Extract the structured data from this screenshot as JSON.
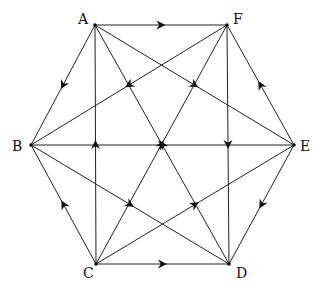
{
  "diagram": {
    "type": "directed-graph",
    "title": "",
    "stroke_color": "#222222",
    "nodes": [
      {
        "id": "A",
        "label": "A",
        "x": 95,
        "y": 25,
        "lx": 78,
        "ly": 12
      },
      {
        "id": "F",
        "label": "F",
        "x": 227,
        "y": 25,
        "lx": 233,
        "ly": 12
      },
      {
        "id": "B",
        "label": "B",
        "x": 31,
        "y": 145,
        "lx": 12,
        "ly": 139
      },
      {
        "id": "E",
        "label": "E",
        "x": 294,
        "y": 145,
        "lx": 300,
        "ly": 139
      },
      {
        "id": "C",
        "label": "C",
        "x": 96,
        "y": 264,
        "lx": 83,
        "ly": 266
      },
      {
        "id": "D",
        "label": "D",
        "x": 229,
        "y": 264,
        "lx": 236,
        "ly": 266
      }
    ],
    "edges": [
      {
        "from": "A",
        "to": "F"
      },
      {
        "from": "A",
        "to": "B"
      },
      {
        "from": "A",
        "to": "E"
      },
      {
        "from": "F",
        "to": "B"
      },
      {
        "from": "F",
        "to": "D"
      },
      {
        "from": "E",
        "to": "F"
      },
      {
        "from": "E",
        "to": "D"
      },
      {
        "from": "B",
        "to": "E"
      },
      {
        "from": "B",
        "to": "D"
      },
      {
        "from": "C",
        "to": "B"
      },
      {
        "from": "C",
        "to": "A"
      },
      {
        "from": "C",
        "to": "D"
      },
      {
        "from": "C",
        "to": "F"
      },
      {
        "from": "C",
        "to": "E"
      },
      {
        "from": "D",
        "to": "A"
      }
    ]
  }
}
